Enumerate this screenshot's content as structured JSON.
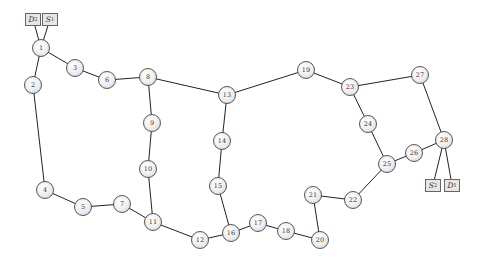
{
  "diagram": {
    "type": "network-graph",
    "nodes": [
      {
        "id": "1",
        "label": "1",
        "x": 41,
        "y": 48
      },
      {
        "id": "2",
        "label": "2",
        "x": 33,
        "y": 85
      },
      {
        "id": "3",
        "label": "3",
        "x": 75,
        "y": 68
      },
      {
        "id": "4",
        "label": "4",
        "x": 45,
        "y": 190
      },
      {
        "id": "5",
        "label": "5",
        "x": 83,
        "y": 207
      },
      {
        "id": "6",
        "label": "6",
        "x": 107,
        "y": 80
      },
      {
        "id": "7",
        "label": "7",
        "x": 122,
        "y": 204
      },
      {
        "id": "8",
        "label": "8",
        "x": 148,
        "y": 77
      },
      {
        "id": "9",
        "label": "9",
        "x": 152,
        "y": 123
      },
      {
        "id": "10",
        "label": "10",
        "x": 148,
        "y": 169
      },
      {
        "id": "11",
        "label": "11",
        "x": 153,
        "y": 222
      },
      {
        "id": "12",
        "label": "12",
        "x": 200,
        "y": 240
      },
      {
        "id": "13",
        "label": "13",
        "x": 227,
        "y": 95
      },
      {
        "id": "14",
        "label": "14",
        "x": 222,
        "y": 141
      },
      {
        "id": "15",
        "label": "15",
        "x": 218,
        "y": 186
      },
      {
        "id": "16",
        "label": "16",
        "x": 231,
        "y": 233
      },
      {
        "id": "17",
        "label": "17",
        "x": 258,
        "y": 223
      },
      {
        "id": "18",
        "label": "18",
        "x": 286,
        "y": 231
      },
      {
        "id": "19",
        "label": "19",
        "x": 306,
        "y": 70
      },
      {
        "id": "20",
        "label": "20",
        "x": 320,
        "y": 240
      },
      {
        "id": "21",
        "label": "21",
        "x": 313,
        "y": 195
      },
      {
        "id": "22",
        "label": "22",
        "x": 353,
        "y": 200
      },
      {
        "id": "23",
        "label": "23",
        "x": 350,
        "y": 87
      },
      {
        "id": "24",
        "label": "24",
        "x": 368,
        "y": 124
      },
      {
        "id": "25",
        "label": "25",
        "x": 387,
        "y": 164
      },
      {
        "id": "26",
        "label": "26",
        "x": 414,
        "y": 153
      },
      {
        "id": "27",
        "label": "27",
        "x": 420,
        "y": 75
      },
      {
        "id": "28",
        "label": "28",
        "x": 444,
        "y": 140
      }
    ],
    "terminals": [
      {
        "id": "D2",
        "letter": "D",
        "sub": "2",
        "x": 33,
        "y": 19
      },
      {
        "id": "S1",
        "letter": "S",
        "sub": "1",
        "x": 50,
        "y": 19
      },
      {
        "id": "S2",
        "letter": "S",
        "sub": "2",
        "x": 433,
        "y": 185
      },
      {
        "id": "D1",
        "letter": "D",
        "sub": "1",
        "x": 452,
        "y": 185
      }
    ],
    "edges": [
      [
        "D2",
        "1"
      ],
      [
        "S1",
        "1"
      ],
      [
        "1",
        "2"
      ],
      [
        "1",
        "3"
      ],
      [
        "3",
        "6"
      ],
      [
        "6",
        "8"
      ],
      [
        "2",
        "4"
      ],
      [
        "4",
        "5"
      ],
      [
        "5",
        "7"
      ],
      [
        "7",
        "11"
      ],
      [
        "8",
        "9"
      ],
      [
        "9",
        "10"
      ],
      [
        "10",
        "11"
      ],
      [
        "8",
        "13"
      ],
      [
        "11",
        "12"
      ],
      [
        "12",
        "16"
      ],
      [
        "13",
        "14"
      ],
      [
        "14",
        "15"
      ],
      [
        "15",
        "16"
      ],
      [
        "13",
        "19"
      ],
      [
        "16",
        "17"
      ],
      [
        "17",
        "18"
      ],
      [
        "18",
        "20"
      ],
      [
        "20",
        "21"
      ],
      [
        "21",
        "22"
      ],
      [
        "22",
        "25"
      ],
      [
        "19",
        "23"
      ],
      [
        "23",
        "27"
      ],
      [
        "23",
        "24"
      ],
      [
        "24",
        "25"
      ],
      [
        "25",
        "26"
      ],
      [
        "26",
        "28"
      ],
      [
        "27",
        "28"
      ],
      [
        "28",
        "S2"
      ],
      [
        "28",
        "D1"
      ]
    ],
    "colors": {
      "edge": "#222222",
      "node_border": "#555555",
      "node_fill": "#eeeeee",
      "terminal_fill": "#e6e6e6"
    }
  }
}
